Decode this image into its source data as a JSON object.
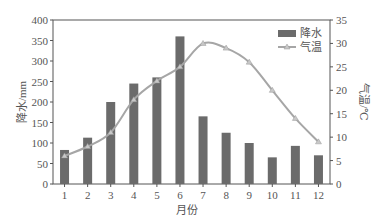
{
  "chart_data": {
    "type": "bar+line",
    "title": "",
    "categories": [
      "1",
      "2",
      "3",
      "4",
      "5",
      "6",
      "7",
      "8",
      "9",
      "10",
      "11",
      "12"
    ],
    "xlabel": "月份",
    "ylabel": "降水/mm",
    "y2label": "气温/℃",
    "ylim": [
      0,
      400
    ],
    "y2lim": [
      0,
      35
    ],
    "yticks": [
      0,
      50,
      100,
      150,
      200,
      250,
      300,
      350,
      400
    ],
    "y2ticks": [
      0,
      5,
      10,
      15,
      20,
      25,
      30,
      35
    ],
    "series": [
      {
        "name": "降水",
        "type": "bar",
        "axis": "left",
        "color": "#6b6b6b",
        "values": [
          83,
          113,
          200,
          245,
          260,
          360,
          165,
          125,
          100,
          65,
          93,
          70
        ]
      },
      {
        "name": "气温",
        "type": "line",
        "axis": "right",
        "color": "#a6a6a6",
        "marker": "triangle",
        "values": [
          6,
          8,
          11,
          18,
          22,
          25,
          30,
          29,
          26,
          20,
          14,
          9
        ]
      }
    ],
    "legend_position": "upper right",
    "grid": false
  }
}
